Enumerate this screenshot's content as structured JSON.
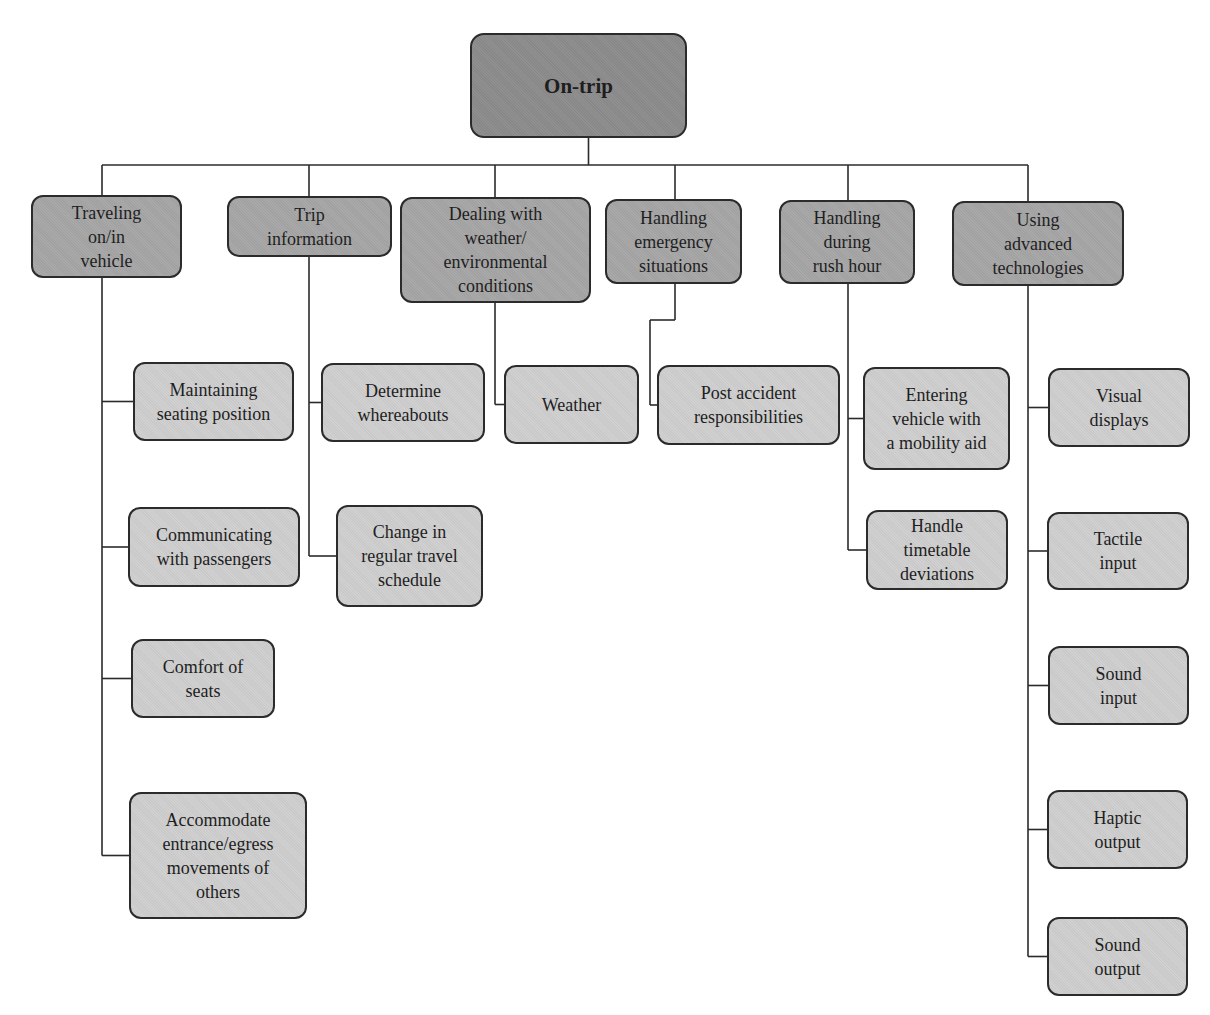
{
  "diagram": {
    "type": "tree",
    "colors": {
      "root": "#8c8c8c",
      "category": "#a6a6a6",
      "leaf": "#cfcfcf",
      "stroke": "#2b2b2b"
    },
    "root": {
      "label": "On-trip",
      "box": [
        470,
        33,
        217,
        105
      ]
    },
    "bus_y": 165,
    "categories": [
      {
        "id": "traveling",
        "label": "Traveling\non/in\nvehicle",
        "box": [
          31,
          195,
          151,
          83
        ],
        "stem_x": 102,
        "children": [
          {
            "label": "Maintaining\nseating position",
            "box": [
              133,
              362,
              161,
              79
            ]
          },
          {
            "label": "Communicating\nwith passengers",
            "box": [
              128,
              507,
              172,
              80
            ]
          },
          {
            "label": "Comfort of\nseats",
            "box": [
              131,
              639,
              144,
              79
            ]
          },
          {
            "label": "Accommodate\nentrance/egress\nmovements of\nothers",
            "box": [
              129,
              792,
              178,
              127
            ]
          }
        ]
      },
      {
        "id": "trip-info",
        "label": "Trip\ninformation",
        "box": [
          227,
          196,
          165,
          61
        ],
        "stem_x": 309,
        "children": [
          {
            "label": "Determine\nwhereabouts",
            "box": [
              321,
              363,
              164,
              79
            ]
          },
          {
            "label": "Change in\nregular travel\nschedule",
            "box": [
              336,
              505,
              147,
              102
            ]
          }
        ]
      },
      {
        "id": "weather",
        "label": "Dealing with\nweather/\nenvironmental\nconditions",
        "box": [
          400,
          197,
          191,
          106
        ],
        "stem_x": 495,
        "children": [
          {
            "label": "Weather",
            "box": [
              504,
              365,
              135,
              79
            ]
          }
        ]
      },
      {
        "id": "emergency",
        "label": "Handling\nemergency\nsituations",
        "box": [
          605,
          199,
          137,
          85
        ],
        "stem_x": 675,
        "jog": {
          "y": 320,
          "x": 650
        },
        "children": [
          {
            "label": "Post accident\nresponsibilities",
            "box": [
              657,
              365,
              183,
              80
            ]
          }
        ]
      },
      {
        "id": "rush-hour",
        "label": "Handling\nduring\nrush hour",
        "box": [
          779,
          200,
          136,
          84
        ],
        "stem_x": 848,
        "children": [
          {
            "label": "Entering\nvehicle with\na mobility aid",
            "box": [
              863,
              367,
              147,
              103
            ]
          },
          {
            "label": "Handle\ntimetable\ndeviations",
            "box": [
              866,
              510,
              142,
              80
            ]
          }
        ]
      },
      {
        "id": "advanced-tech",
        "label": "Using\nadvanced\ntechnologies",
        "box": [
          952,
          201,
          172,
          85
        ],
        "stem_x": 1028,
        "children": [
          {
            "label": "Visual\ndisplays",
            "box": [
              1048,
              368,
              142,
              79
            ]
          },
          {
            "label": "Tactile\ninput",
            "box": [
              1047,
              512,
              142,
              78
            ]
          },
          {
            "label": "Sound\ninput",
            "box": [
              1048,
              646,
              141,
              79
            ]
          },
          {
            "label": "Haptic\noutput",
            "box": [
              1047,
              790,
              141,
              79
            ]
          },
          {
            "label": "Sound\noutput",
            "box": [
              1047,
              917,
              141,
              79
            ]
          }
        ]
      }
    ]
  }
}
